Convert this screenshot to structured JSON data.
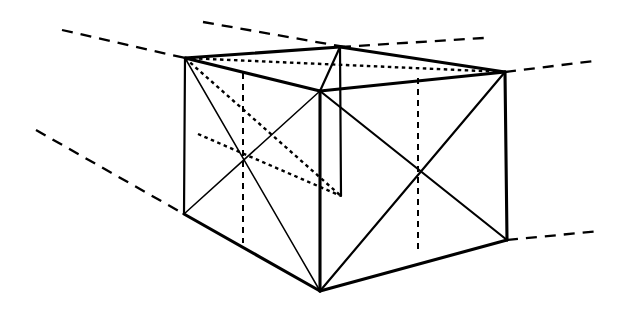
{
  "figure": {
    "type": "technical-line-drawing",
    "canvas": {
      "width": 631,
      "height": 310,
      "background": "#ffffff"
    },
    "ink_color": "#000000"
  },
  "vertices": {
    "top_left": [
      185,
      58
    ],
    "top_back": [
      340,
      47
    ],
    "top_right": [
      505,
      72
    ],
    "top_front": [
      320,
      91
    ],
    "bottom_left": [
      184,
      214
    ],
    "bottom_front": [
      320,
      291
    ],
    "bottom_right": [
      507,
      240
    ],
    "bottom_back_hidden": [
      341,
      196
    ]
  },
  "edges": {
    "top_face": [
      {
        "name": "top-left-to-top-back",
        "points": "185,58 340,47",
        "style": "solid-heavy"
      },
      {
        "name": "top-back-to-top-right",
        "points": "340,47 505,72",
        "style": "solid-heavy"
      },
      {
        "name": "top-left-to-top-front",
        "points": "185,58 320,91",
        "style": "solid-heavy"
      },
      {
        "name": "top-front-to-top-right",
        "points": "320,91 505,72",
        "style": "solid-heavy"
      }
    ],
    "vertical_edges": [
      {
        "name": "left-vertical-edge",
        "points": "185,58 184,214",
        "style": "solid-medium"
      },
      {
        "name": "front-vertical-edge",
        "points": "320,91 320,291",
        "style": "solid-heavy"
      },
      {
        "name": "right-vertical-edge",
        "points": "505,72 507,240",
        "style": "solid-heavy"
      },
      {
        "name": "back-vertical-edge-hidden",
        "points": "340,47 341,196",
        "style": "solid-medium"
      }
    ],
    "bottom_face": [
      {
        "name": "bottom-left-to-bottom-front",
        "points": "184,214 320,291",
        "style": "solid-heavy"
      },
      {
        "name": "bottom-front-to-bottom-right",
        "points": "320,291 507,240",
        "style": "solid-heavy"
      }
    ]
  },
  "face_diagonals": {
    "left_face": [
      {
        "name": "left-face-diagonal-a",
        "points": "185,58 320,291",
        "style": "solid-light"
      },
      {
        "name": "left-face-diagonal-b",
        "points": "184,214 320,91",
        "style": "solid-light"
      }
    ],
    "right_face": [
      {
        "name": "right-face-diagonal-a",
        "points": "320,91 507,240",
        "style": "solid-medium"
      },
      {
        "name": "right-face-diagonal-b",
        "points": "320,291 505,72",
        "style": "solid-medium"
      }
    ],
    "top_face": [
      {
        "name": "top-face-diagonal-visible",
        "points": "340,47 320,91",
        "style": "solid-medium"
      },
      {
        "name": "top-face-diagonal-hidden",
        "points": "185,58 505,72",
        "style": "hidden-dot"
      }
    ]
  },
  "hidden_construction": {
    "vertical_center_left": {
      "name": "left-face-center-vertical",
      "points": "243,73 243,243",
      "style": "hidden-dash"
    },
    "vertical_center_right": {
      "name": "right-face-center-vertical",
      "points": "418,78 418,253",
      "style": "hidden-dash"
    },
    "back_face_diagonal": {
      "name": "back-face-hidden-diagonal",
      "points": "198,134 341,196",
      "style": "hidden-dot"
    },
    "top_face_back_line": {
      "name": "top-face-hidden-back-line",
      "points": "185,58 341,196",
      "style": "hidden-dot"
    }
  },
  "guide_lines": [
    {
      "name": "guide-upper-left",
      "points": "62,30 185,58",
      "style": "guide-dash"
    },
    {
      "name": "guide-upper-mid",
      "points": "203,22 345,47",
      "style": "guide-dash"
    },
    {
      "name": "guide-upper-right-inner",
      "points": "340,47 484,38",
      "style": "guide-dash"
    },
    {
      "name": "guide-upper-right-outer",
      "points": "505,72 594,61",
      "style": "guide-dash"
    },
    {
      "name": "guide-lower-left",
      "points": "36,130 184,214",
      "style": "guide-dash"
    },
    {
      "name": "guide-lower-right",
      "points": "507,240 600,231",
      "style": "guide-dash"
    }
  ],
  "intersection_markers": {
    "left_face_center": [
      243,
      157
    ],
    "right_face_center": [
      418,
      173
    ]
  }
}
